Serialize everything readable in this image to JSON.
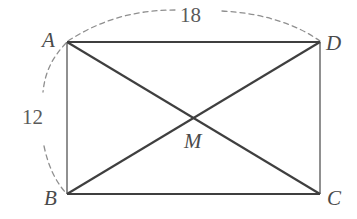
{
  "figure": {
    "kind": "rectangle-with-diagonals",
    "background_color": "#ffffff",
    "stroke_color_dark": "#3c3c3c",
    "stroke_color_light": "#808080",
    "dash_color": "#8a8a8a",
    "label_color": "#4a4a4a",
    "vertices": [
      {
        "name": "A",
        "label": "A",
        "x": 67,
        "y": 42,
        "label_x": 42,
        "label_y": 30
      },
      {
        "name": "D",
        "label": "D",
        "x": 320,
        "y": 42,
        "label_x": 326,
        "label_y": 33
      },
      {
        "name": "B",
        "label": "B",
        "x": 67,
        "y": 194,
        "label_x": 44,
        "label_y": 188
      },
      {
        "name": "C",
        "label": "C",
        "x": 320,
        "y": 194,
        "label_x": 327,
        "label_y": 188
      }
    ],
    "intersection": {
      "name": "M",
      "label": "M",
      "x": 193,
      "y": 118,
      "label_x": 184,
      "label_y": 131
    },
    "measurements": [
      {
        "name": "top-side-length",
        "label": "18",
        "value": 18,
        "edge": "AD",
        "x": 180,
        "y": 5
      },
      {
        "name": "left-side-length",
        "label": "12",
        "value": 12,
        "edge": "AB",
        "x": 22,
        "y": 107
      }
    ],
    "edges": [
      {
        "name": "edge-AD",
        "from": "A",
        "to": "D",
        "style": "solid-dark"
      },
      {
        "name": "edge-DC",
        "from": "D",
        "to": "C",
        "style": "solid-light"
      },
      {
        "name": "edge-CB",
        "from": "C",
        "to": "B",
        "style": "solid-dark"
      },
      {
        "name": "edge-BA",
        "from": "B",
        "to": "A",
        "style": "solid-light"
      }
    ],
    "diagonals": [
      {
        "name": "diagonal-AC",
        "from": "A",
        "to": "C",
        "style": "solid-dark"
      },
      {
        "name": "diagonal-BD",
        "from": "B",
        "to": "D",
        "style": "solid-dark"
      }
    ],
    "dimension_arcs": [
      {
        "name": "arc-top-18",
        "for": "18",
        "style": "dashed"
      },
      {
        "name": "arc-left-12",
        "for": "12",
        "style": "dashed"
      }
    ]
  }
}
